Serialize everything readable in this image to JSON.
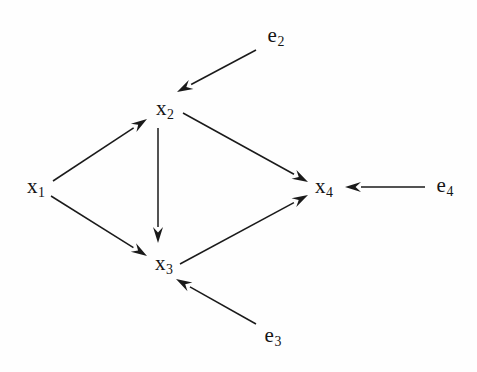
{
  "figure": {
    "kind": "causal-dag",
    "background_color": "#fefefe",
    "ink_color": "#1a1a1a",
    "width": 477,
    "height": 372
  },
  "nodes": [
    {
      "id": "x1",
      "base": "x",
      "sub": "1",
      "x": 36,
      "y": 188,
      "role": "variable"
    },
    {
      "id": "x2",
      "base": "x",
      "sub": "2",
      "x": 165,
      "y": 110,
      "role": "variable"
    },
    {
      "id": "x3",
      "base": "x",
      "sub": "3",
      "x": 164,
      "y": 265,
      "role": "variable"
    },
    {
      "id": "x4",
      "base": "x",
      "sub": "4",
      "x": 324,
      "y": 188,
      "role": "variable"
    },
    {
      "id": "e2",
      "base": "e",
      "sub": "2",
      "x": 276,
      "y": 37,
      "role": "error-term"
    },
    {
      "id": "e3",
      "base": "e",
      "sub": "3",
      "x": 273,
      "y": 337,
      "role": "error-term"
    },
    {
      "id": "e4",
      "base": "e",
      "sub": "4",
      "x": 445,
      "y": 187,
      "role": "error-term"
    }
  ],
  "edges": [
    {
      "id": "e-x1-x2",
      "from": "x1",
      "to": "x2",
      "x1": 53,
      "y1": 181,
      "x2": 147,
      "y2": 119
    },
    {
      "id": "e-x1-x3",
      "from": "x1",
      "to": "x3",
      "x1": 51,
      "y1": 196,
      "x2": 147,
      "y2": 256
    },
    {
      "id": "e-x2-x3",
      "from": "x2",
      "to": "x3",
      "x1": 158,
      "y1": 128,
      "x2": 158,
      "y2": 243
    },
    {
      "id": "e-x2-x4",
      "from": "x2",
      "to": "x4",
      "x1": 183,
      "y1": 113,
      "x2": 308,
      "y2": 182
    },
    {
      "id": "e-x3-x4",
      "from": "x3",
      "to": "x4",
      "x1": 180,
      "y1": 264,
      "x2": 308,
      "y2": 195
    },
    {
      "id": "e-e2-x2",
      "from": "e2",
      "to": "x2",
      "x1": 256,
      "y1": 50,
      "x2": 177,
      "y2": 92
    },
    {
      "id": "e-e3-x3",
      "from": "e3",
      "to": "x3",
      "x1": 256,
      "y1": 324,
      "x2": 176,
      "y2": 279
    },
    {
      "id": "e-e4-x4",
      "from": "e4",
      "to": "x4",
      "x1": 425,
      "y1": 187,
      "x2": 345,
      "y2": 187
    }
  ],
  "style": {
    "stroke_width": 1.5,
    "arrow_length": 16,
    "arrow_half_width": 5
  }
}
